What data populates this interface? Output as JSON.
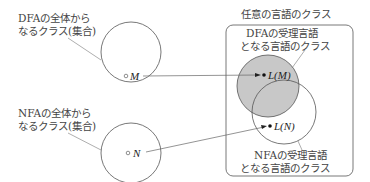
{
  "diagram": {
    "dfa_set": {
      "label_line1": "DFAの全体から",
      "label_line2": "なるクラス(集合)",
      "element": "M"
    },
    "nfa_set": {
      "label_line1": "NFAの全体から",
      "label_line2": "なるクラス(集合)",
      "element": "N"
    },
    "language_box": {
      "title": "任意の言語のクラス",
      "dfa_region": {
        "label_line1": "DFAの受理言語",
        "label_line2": "となる言語のクラス",
        "element": "L(M)",
        "fill": "#c8c8c8"
      },
      "nfa_region": {
        "label_line1": "NFAの受理言語",
        "label_line2": "となる言語のクラス",
        "element": "L(N)"
      }
    },
    "colors": {
      "stroke": "#555555",
      "gray_fill": "#c8c8c8",
      "text": "#444444"
    }
  }
}
